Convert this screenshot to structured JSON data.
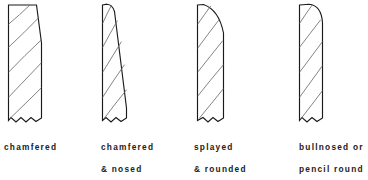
{
  "figure": {
    "background_color": "#ffffff",
    "outline_color": "#1a1a1a",
    "grain_color": "#6d6d6d",
    "text_color": "#212121"
  },
  "profiles": [
    {
      "id": "chamfered",
      "caption_line1": "chamfered",
      "caption_line2": "",
      "top_edge": "straight-chamfer",
      "description": "Square board with a long flat chamfer cut from the top-left across to the right face"
    },
    {
      "id": "chamfered-and-nosed",
      "caption_line1": "chamfered",
      "caption_line2": "& nosed",
      "top_edge": "rounded-nose-then-chamfer",
      "description": "Small rounded nose at the top leading into a long chamfer down to the right face"
    },
    {
      "id": "splayed-and-rounded",
      "caption_line1": "splayed",
      "caption_line2": "& rounded",
      "top_edge": "splay-then-round",
      "description": "Short splay off the top edge blending into a rounded shoulder on the right face"
    },
    {
      "id": "bullnosed-or-pencil-round",
      "caption_line1": "bullnosed  or",
      "caption_line2": "pencil  round",
      "top_edge": "full-bullnose",
      "description": "Flat top with a generous bullnose radius turning onto the right face"
    }
  ]
}
